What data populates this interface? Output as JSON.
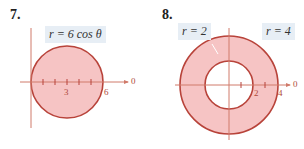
{
  "problem7": {
    "number": "7.",
    "equation": "r = 6 cos θ",
    "tick_labels": [
      "3",
      "6"
    ],
    "axis_label": "0"
  },
  "problem8": {
    "number": "8.",
    "inner_label": "r = 2",
    "outer_label": "r = 4",
    "tick_labels": [
      "2",
      "4"
    ],
    "axis_label": "0"
  },
  "colors": {
    "fill": "#f4bcbc",
    "stroke": "#b8433a",
    "axis": "#d58070",
    "label_bg": "#e7eef5"
  }
}
